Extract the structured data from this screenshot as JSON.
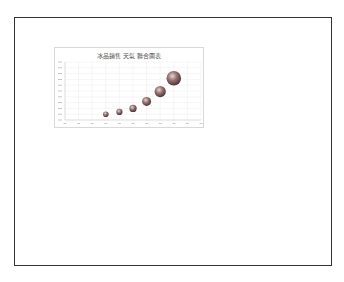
{
  "page": {
    "border_color": "#333333"
  },
  "chart_data": {
    "type": "bubble",
    "title": "冰品銷售 天氣 聯合圖表",
    "xlabel": "",
    "ylabel": "",
    "x_ticks_count": 10,
    "y_ticks_count": 10,
    "grid": true,
    "legend": "none",
    "bubble_color": "#8a6a6a",
    "series": [
      {
        "name": "",
        "points": [
          {
            "x": 3,
            "y": 1.0,
            "size": 1.0
          },
          {
            "x": 4,
            "y": 1.4,
            "size": 1.1
          },
          {
            "x": 5,
            "y": 2.0,
            "size": 1.3
          },
          {
            "x": 6,
            "y": 3.2,
            "size": 1.6
          },
          {
            "x": 7,
            "y": 4.9,
            "size": 2.0
          },
          {
            "x": 8,
            "y": 7.2,
            "size": 2.6
          }
        ]
      }
    ]
  }
}
